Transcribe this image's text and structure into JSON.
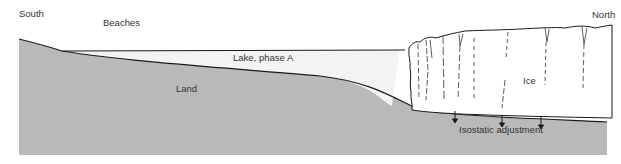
{
  "labels": {
    "south": "South",
    "north": "North",
    "beaches": "Beaches",
    "lake": "Lake, phase A",
    "land": "Land",
    "ice": "Ice",
    "isostatic": "Isostatic adjustment"
  },
  "colors": {
    "land": "#b9b9b9",
    "lake": "#f3f3f3",
    "ice": "#ffffff",
    "line": "#1a1a1a",
    "text": "#333333",
    "background": "#ffffff"
  }
}
